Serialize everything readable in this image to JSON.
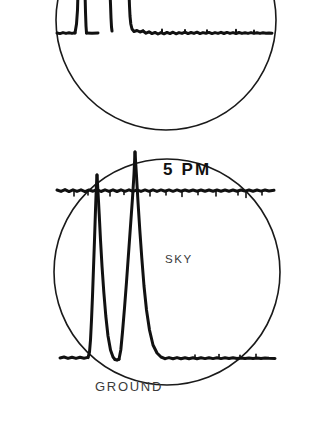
{
  "figure": {
    "background_color": "#ffffff",
    "ink_color": "#111111",
    "width": 333,
    "height": 431
  },
  "scopes": [
    {
      "id": "upper-scope",
      "name": "upper-oscilloscope-display",
      "cropped": true,
      "circle": {
        "cx": 166,
        "cy": 20,
        "r": 110,
        "stroke": "#1a1a1a",
        "stroke_width": 1.6
      },
      "labels": [],
      "trace": {
        "name": "upper-waveform-trace",
        "baseline_y": 33,
        "stroke": "#111111",
        "stroke_width": 3.0,
        "description": "Flat noisy ground return with a vertical rise near left and a tall saturated block, then a noisy decaying plateau to the right."
      }
    },
    {
      "id": "lower-scope",
      "name": "lower-oscilloscope-display",
      "cropped": false,
      "circle": {
        "cx": 167,
        "cy": 272,
        "r": 113,
        "stroke": "#1a1a1a",
        "stroke_width": 1.6
      },
      "labels": [
        {
          "name": "time-label",
          "text": "5 PM",
          "x": 163,
          "y": 175,
          "class": "label-time"
        },
        {
          "name": "sky-label",
          "text": "SKY",
          "x": 165,
          "y": 263,
          "class": "label-sky"
        },
        {
          "name": "ground-label",
          "text": "GROUND",
          "x": 95,
          "y": 391,
          "class": "label-ground"
        }
      ],
      "trace": {
        "name": "lower-waveform-trace",
        "sky_baseline_y": 190,
        "ground_baseline_y": 358,
        "stroke": "#111111",
        "stroke_width": 3.0,
        "peaks": [
          {
            "name": "peak-1",
            "x": 97,
            "tip_y": 175,
            "height_label": "smaller"
          },
          {
            "name": "peak-2",
            "x": 135,
            "tip_y": 152,
            "height_label": "taller"
          }
        ],
        "description": "Two tall vertical spikes rising from the ground baseline through the sky line, with a flat noisy ground return to the left and right."
      }
    }
  ]
}
